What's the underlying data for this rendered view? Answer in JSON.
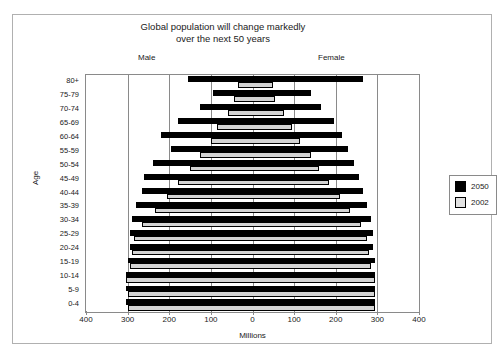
{
  "chart_data": {
    "type": "bar",
    "subtype": "population-pyramid",
    "title": "Global population will change markedly over the next 50 years",
    "title_lines": [
      "Global population will change markedly",
      "over the next 50 years"
    ],
    "xlabel": "Millions",
    "ylabel": "Age",
    "side_labels": {
      "left": "Male",
      "right": "Female"
    },
    "xlim": [
      -400,
      400
    ],
    "xticks": [
      400,
      300,
      200,
      100,
      0,
      100,
      200,
      300,
      400
    ],
    "xtick_labels": [
      "400",
      "300",
      "200",
      "100",
      "0",
      "100",
      "200",
      "300",
      "400"
    ],
    "grid": true,
    "legend": {
      "position": "right-outside",
      "entries": [
        {
          "name": "2050",
          "color": "#000000"
        },
        {
          "name": "2002",
          "color": "#e2e2e2"
        }
      ]
    },
    "categories": [
      "80+",
      "75-79",
      "70-74",
      "65-69",
      "60-64",
      "55-59",
      "50-54",
      "45-49",
      "40-44",
      "35-39",
      "30-34",
      "25-29",
      "20-24",
      "15-19",
      "10-14",
      "5-9",
      "0-4"
    ],
    "series": [
      {
        "name": "2050",
        "color": "#000000",
        "male": [
          155,
          95,
          125,
          180,
          220,
          195,
          240,
          260,
          265,
          280,
          290,
          295,
          295,
          300,
          305,
          305,
          305
        ],
        "female": [
          265,
          140,
          165,
          195,
          215,
          230,
          245,
          255,
          265,
          275,
          285,
          290,
          290,
          295,
          295,
          295,
          295
        ]
      },
      {
        "name": "2002",
        "color": "#e2e2e2",
        "male": [
          35,
          45,
          60,
          85,
          100,
          125,
          150,
          180,
          205,
          235,
          265,
          285,
          290,
          295,
          305,
          300,
          300
        ],
        "female": [
          50,
          55,
          75,
          95,
          115,
          140,
          160,
          185,
          210,
          235,
          260,
          275,
          280,
          285,
          295,
          295,
          295
        ]
      }
    ]
  }
}
